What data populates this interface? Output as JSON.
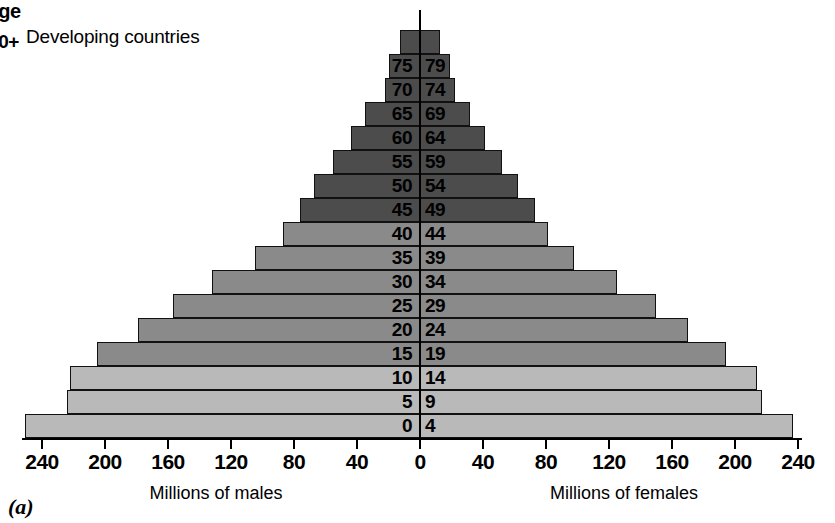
{
  "figure": {
    "region_title": "Developing countries",
    "age_header": "Age",
    "caption": "(a)"
  },
  "axis": {
    "left_title": "Millions of males",
    "right_title": "Millions of females",
    "tick_labels_left": [
      "240",
      "200",
      "160",
      "120",
      "80",
      "40"
    ],
    "tick_label_center": "0",
    "tick_labels_right": [
      "40",
      "80",
      "120",
      "160",
      "200",
      "240"
    ]
  },
  "colors": {
    "band_light": "#b9b9b9",
    "band_mid": "#8a8a8a",
    "band_dark": "#4c4c4c",
    "outline": "#111111",
    "background": "#ffffff"
  },
  "chart_data": {
    "type": "bar",
    "subtype": "population-pyramid",
    "title": "Developing countries",
    "xlabel": "Millions of males / Millions of females",
    "ylabel": "Age",
    "xlim": [
      -240,
      240
    ],
    "x_tick_step": 40,
    "grid": false,
    "legend": "none",
    "categories": [
      "0-4",
      "5-9",
      "10-14",
      "15-19",
      "20-24",
      "25-29",
      "30-34",
      "35-39",
      "40-44",
      "45-49",
      "50-54",
      "55-59",
      "60-64",
      "65-69",
      "70-74",
      "75-79",
      "80+"
    ],
    "series": [
      {
        "name": "Millions of males",
        "side": "left",
        "values": [
          251,
          224,
          222,
          205,
          179,
          157,
          132,
          105,
          87,
          76,
          67,
          55,
          44,
          35,
          22,
          20,
          13
        ]
      },
      {
        "name": "Millions of females",
        "side": "right",
        "values": [
          237,
          217,
          214,
          194,
          170,
          150,
          125,
          98,
          81,
          73,
          62,
          52,
          41,
          32,
          22,
          19,
          13
        ]
      }
    ],
    "shading": {
      "0-4": "light",
      "5-9": "light",
      "10-14": "light",
      "15-19": "mid",
      "20-24": "mid",
      "25-29": "mid",
      "30-34": "mid",
      "35-39": "mid",
      "40-44": "mid",
      "45-49": "dark",
      "50-54": "dark",
      "55-59": "dark",
      "60-64": "dark",
      "65-69": "dark",
      "70-74": "dark",
      "75-79": "dark",
      "80+": "dark"
    }
  }
}
